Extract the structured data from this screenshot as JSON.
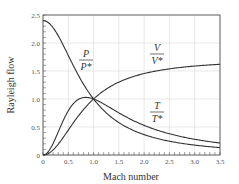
{
  "chart_data": {
    "type": "line",
    "title": "",
    "xlabel": "Mach number",
    "ylabel": "Rayleigh flow",
    "xlim": [
      0,
      3.5
    ],
    "ylim": [
      0,
      2.5
    ],
    "grid": true,
    "x_ticks": [
      "0",
      "0.5",
      "1.0",
      "1.5",
      "2.0",
      "2.5",
      "3.0",
      "3.5"
    ],
    "y_ticks": [
      "0",
      "0.5",
      "1.0",
      "1.5",
      "2.0",
      "2.5"
    ],
    "x": [
      0,
      0.25,
      0.5,
      0.75,
      1.0,
      1.25,
      1.5,
      1.75,
      2.0,
      2.5,
      3.0,
      3.5
    ],
    "series": [
      {
        "name": "P/P*",
        "label_num": "P",
        "label_den": "P*",
        "values": [
          2.4,
          2.21,
          1.78,
          1.35,
          1.0,
          0.75,
          0.58,
          0.45,
          0.36,
          0.24,
          0.17,
          0.13
        ]
      },
      {
        "name": "T/T*",
        "label_num": "T",
        "label_den": "T*",
        "values": [
          0,
          0.31,
          0.79,
          1.03,
          1.0,
          0.88,
          0.75,
          0.63,
          0.53,
          0.38,
          0.28,
          0.21
        ]
      },
      {
        "name": "V/V*",
        "label_num": "V",
        "label_den": "V*",
        "values": [
          0,
          0.14,
          0.44,
          0.76,
          1.0,
          1.17,
          1.29,
          1.37,
          1.45,
          1.54,
          1.6,
          1.62
        ]
      }
    ],
    "gamma": 1.4
  }
}
